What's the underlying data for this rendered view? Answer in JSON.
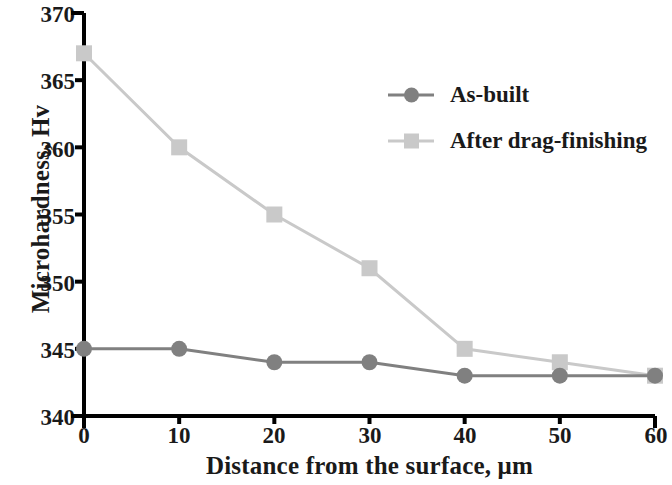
{
  "chart_data": {
    "type": "line",
    "title": "",
    "xlabel": "Distance from the surface, μm",
    "ylabel": "Microhardness, Hv",
    "x": [
      0,
      10,
      20,
      30,
      40,
      50,
      60
    ],
    "xlim": [
      0,
      60
    ],
    "ylim": [
      340,
      370
    ],
    "xticks": [
      "0",
      "10",
      "20",
      "30",
      "40",
      "50",
      "60"
    ],
    "yticks": [
      "340",
      "345",
      "350",
      "355",
      "360",
      "365",
      "370"
    ],
    "grid": false,
    "legend_position": "upper right",
    "series": [
      {
        "name": "As-built",
        "marker": "circle",
        "color": "#808080",
        "values": [
          345,
          345,
          344,
          344,
          343,
          343,
          343
        ]
      },
      {
        "name": "After drag-finishing",
        "marker": "square",
        "color": "#c9c9c9",
        "values": [
          367,
          360,
          355,
          351,
          345,
          344,
          343
        ]
      }
    ]
  },
  "legend": {
    "entries": [
      {
        "label": "As-built"
      },
      {
        "label": "After drag-finishing"
      }
    ]
  },
  "axes": {
    "x_title": "Distance from the surface, μm",
    "y_title": "Microhardness, Hv",
    "x_tick_labels": [
      "0",
      "10",
      "20",
      "30",
      "40",
      "50",
      "60"
    ],
    "y_tick_labels": [
      "340",
      "345",
      "350",
      "355",
      "360",
      "365",
      "370"
    ]
  },
  "colors": {
    "axis": "#000000",
    "series_as_built": "#808080",
    "series_after_drag_finishing": "#c9c9c9",
    "text": "#1a1a1a",
    "background": "#ffffff"
  }
}
